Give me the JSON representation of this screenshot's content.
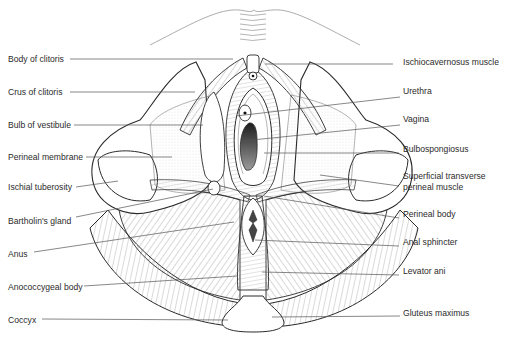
{
  "figure": {
    "type": "labeled anatomical illustration",
    "colors": {
      "line": "#2a2a2a",
      "hatch": "#6a6a6a",
      "label": "#2b2b2b",
      "leader": "#555555",
      "background": "#ffffff",
      "lumen_dark": "#3a3a3a"
    }
  },
  "labels": {
    "left": [
      {
        "id": "body-of-clitoris",
        "text": "Body of clitoris",
        "x": 8,
        "y": 62,
        "line": [
          70,
          59,
          233,
          59
        ]
      },
      {
        "id": "crus-of-clitoris",
        "text": "Crus of clitoris",
        "x": 8,
        "y": 95,
        "line": [
          70,
          92,
          195,
          92
        ]
      },
      {
        "id": "bulb-of-vestibule",
        "text": "Bulb of vestibule",
        "x": 8,
        "y": 128,
        "line": [
          74,
          125,
          203,
          125
        ]
      },
      {
        "id": "perineal-membrane",
        "text": "Perineal membrane",
        "x": 8,
        "y": 160,
        "line": [
          86,
          157,
          172,
          157
        ]
      },
      {
        "id": "ischial-tuberosity",
        "text": "Ischial tuberosity",
        "x": 8,
        "y": 190,
        "line": [
          76,
          187,
          118,
          181
        ]
      },
      {
        "id": "bartholins-gland",
        "text": "Bartholin's gland",
        "x": 8,
        "y": 224,
        "line": [
          76,
          217,
          213,
          189
        ]
      },
      {
        "id": "anus",
        "text": "Anus",
        "x": 8,
        "y": 257,
        "line": [
          34,
          252,
          234,
          222
        ]
      },
      {
        "id": "anococcygeal-body",
        "text": "Anococcygeal body",
        "x": 8,
        "y": 290,
        "line": [
          84,
          286,
          237,
          276
        ]
      },
      {
        "id": "coccyx",
        "text": "Coccyx",
        "x": 8,
        "y": 323,
        "line": [
          42,
          319,
          228,
          320
        ]
      }
    ],
    "right": [
      {
        "id": "ischiocavernosus-muscle",
        "text": "Ischiocavernosus muscle",
        "x": 403,
        "y": 65,
        "line": [
          265,
          64,
          393,
          64
        ]
      },
      {
        "id": "urethra",
        "text": "Urethra",
        "x": 403,
        "y": 94,
        "line": [
          236,
          116,
          400,
          97
        ]
      },
      {
        "id": "vagina",
        "text": "Vagina",
        "x": 403,
        "y": 122,
        "line": [
          242,
          141,
          400,
          125
        ]
      },
      {
        "id": "bulbospongiosus",
        "text": "Bulbospongiosus",
        "x": 403,
        "y": 152,
        "line": [
          264,
          153,
          399,
          153
        ]
      },
      {
        "id": "superficial-transverse-perineal-muscle",
        "text": "Superficial transverse",
        "text2": "perineal muscle",
        "x": 403,
        "y": 179,
        "y2": 190,
        "line": [
          320,
          175,
          399,
          186
        ]
      },
      {
        "id": "perineal-body",
        "text": "Perineal body",
        "x": 403,
        "y": 217,
        "line": [
          264,
          196,
          399,
          218
        ]
      },
      {
        "id": "anal-sphincter",
        "text": "Anal sphincter",
        "x": 403,
        "y": 245,
        "line": [
          255,
          240,
          399,
          246
        ]
      },
      {
        "id": "levator-ani",
        "text": "Levator ani",
        "x": 403,
        "y": 274,
        "line": [
          262,
          272,
          399,
          275
        ]
      },
      {
        "id": "gluteus-maximus",
        "text": "Gluteus maximus",
        "x": 403,
        "y": 316,
        "line": [
          272,
          317,
          400,
          316
        ]
      }
    ]
  }
}
